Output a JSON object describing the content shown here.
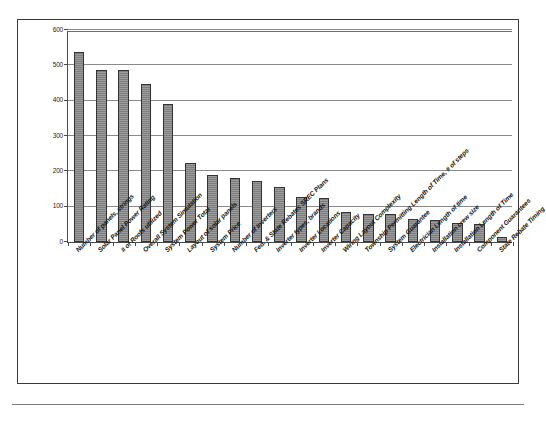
{
  "chart_data": {
    "type": "bar",
    "title": "",
    "subtitle": "",
    "xlabel": "",
    "ylabel": "",
    "ylim": [
      0,
      600
    ],
    "ytick_values": [
      0,
      100,
      200,
      300,
      400,
      500,
      600
    ],
    "ytick_labels": [
      "0",
      "100",
      "200",
      "300",
      "400",
      "500",
      "600"
    ],
    "grid": true,
    "grid_axis": "y",
    "legend": false,
    "legend_position": "none",
    "orientation": "vertical",
    "bar_color": "#7f7f7f",
    "bar_edge_color": "#333333",
    "categories": [
      "Number of panels, strings",
      "Solar Panel Power Rating",
      "# of Roofs utilized",
      "Overall System Simulation",
      "System Power Total",
      "Layout of solar panels",
      "System Price",
      "Number of Inverters",
      "Fed. & State Rebates SREC Plans",
      "Inverter types, brands",
      "Inverter Locations",
      "Inverter Capacity",
      "Wiring Layout Complexity",
      "Township Permitting Length of Time, # of steps",
      "System Guarantee",
      "Electrician Length of time",
      "Installation crew size",
      "Installation Length of Time",
      "Component Guarantees",
      "State Rebate Timing"
    ],
    "values": [
      537,
      488,
      488,
      448,
      390,
      223,
      190,
      180,
      174,
      156,
      128,
      125,
      86,
      79,
      80,
      66,
      63,
      54,
      50,
      15
    ]
  }
}
